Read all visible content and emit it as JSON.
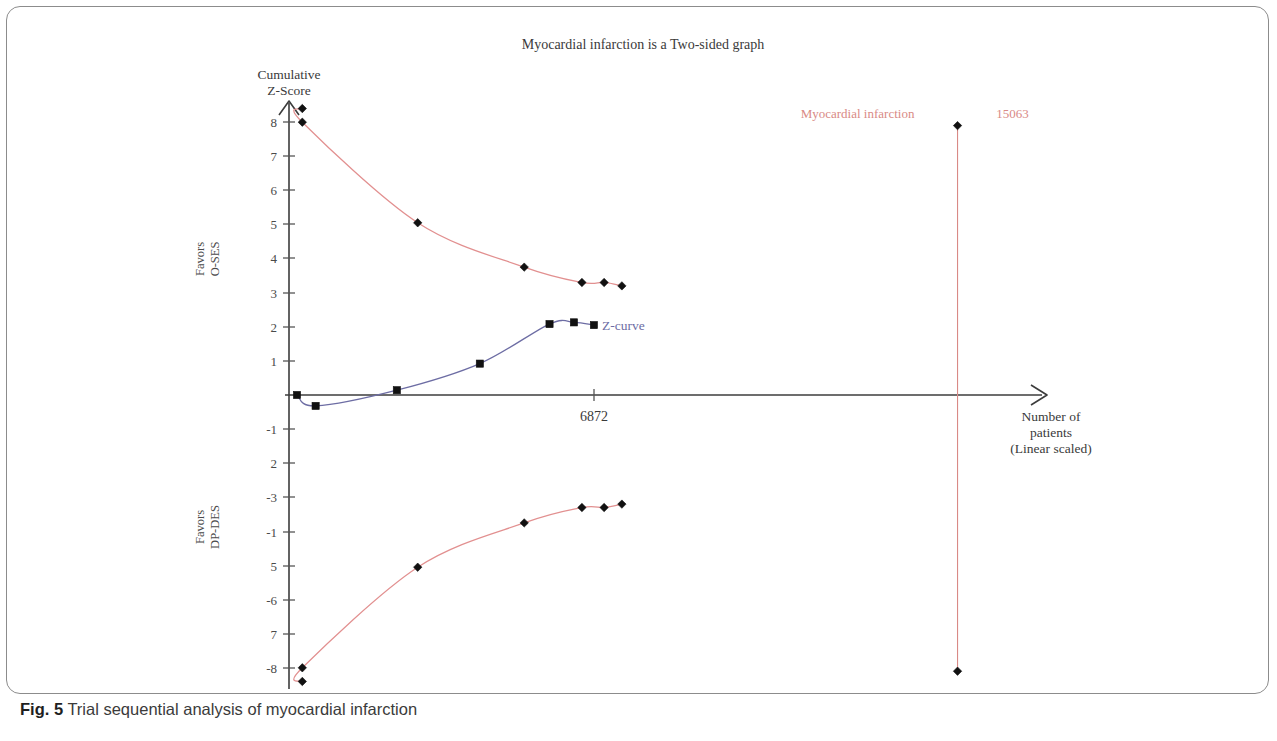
{
  "figure": {
    "caption_label": "Fig. 5",
    "caption_text": "Trial sequential analysis of myocardial infarction"
  },
  "colors": {
    "boundary_red": "#e29090",
    "zcurve_blue": "#6d6da4",
    "axis_gray": "#3c3c3c",
    "marker_black": "#111111",
    "ris_red": "#e08a8a",
    "ris_text_red": "#d98a86",
    "frame_gray": "#8c8c8c"
  },
  "chart_data": {
    "type": "line",
    "title": "Myocardial infarction is a Two-sided graph",
    "xlabel": "Number of patients (Linear scaled)",
    "xlabel_lines": [
      "Number of",
      "patients",
      "(Linear scaled)"
    ],
    "ylabel": "Cumulative Z-Score",
    "ylabel_lines": [
      "Cumulative",
      "Z-Score"
    ],
    "favors_upper_lines": [
      "Favors",
      "O-SES"
    ],
    "favors_lower_lines": [
      "Favors",
      "DP-DES"
    ],
    "ylim": [
      -8.6,
      8.6
    ],
    "yticks": [
      8,
      7,
      6,
      5,
      4,
      3,
      2,
      1
    ],
    "yticks_negative": [
      "-1",
      "2",
      "-3",
      "-1",
      "5",
      "-6",
      "7",
      "-8"
    ],
    "yticks_negative_values": [
      -1,
      -2,
      -3,
      -4,
      -5,
      -6,
      -7,
      -8
    ],
    "xticks": [
      {
        "label": "6872",
        "x": 6872
      }
    ],
    "xlim": [
      0,
      17800
    ],
    "grid": false,
    "legend_position": "inline-right",
    "series": [
      {
        "name": "Upper trial sequential monitoring boundary",
        "color": "#e29090",
        "marker": "diamond",
        "points": [
          {
            "x": 300,
            "y": 8.4
          },
          {
            "x": 300,
            "y": 8.0
          },
          {
            "x": 2900,
            "y": 5.05
          },
          {
            "x": 5300,
            "y": 3.75
          },
          {
            "x": 6600,
            "y": 3.3
          },
          {
            "x": 7100,
            "y": 3.3
          },
          {
            "x": 7500,
            "y": 3.2
          }
        ]
      },
      {
        "name": "Lower trial sequential monitoring boundary",
        "color": "#e29090",
        "marker": "diamond",
        "points": [
          {
            "x": 300,
            "y": -8.4
          },
          {
            "x": 300,
            "y": -8.0
          },
          {
            "x": 2900,
            "y": -5.05
          },
          {
            "x": 5300,
            "y": -3.75
          },
          {
            "x": 6600,
            "y": -3.3
          },
          {
            "x": 7100,
            "y": -3.3
          },
          {
            "x": 7500,
            "y": -3.2
          }
        ]
      },
      {
        "name": "Z-curve",
        "label": "Z-curve",
        "color": "#6d6da4",
        "marker": "square",
        "points": [
          {
            "x": 180,
            "y": 0.0
          },
          {
            "x": 600,
            "y": -0.32
          },
          {
            "x": 2430,
            "y": 0.14
          },
          {
            "x": 4300,
            "y": 0.92
          },
          {
            "x": 5870,
            "y": 2.08
          },
          {
            "x": 6420,
            "y": 2.13
          },
          {
            "x": 6870,
            "y": 2.05
          }
        ]
      }
    ],
    "annotations": [
      {
        "name": "required-information-size",
        "label": "Myocardial infarction",
        "value": "15063",
        "x": 15063,
        "y_top": 7.9,
        "y_bottom": -8.1,
        "color": "#d98a86"
      }
    ]
  }
}
